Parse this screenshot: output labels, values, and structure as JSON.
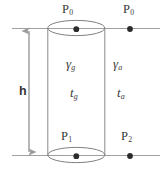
{
  "figure": {
    "colors": {
      "background": "#ffffff",
      "stroke": "#8c8c8c",
      "stroke_dark": "#6f6f6f",
      "dot": "#2b2b2b",
      "text": "#3a3a3a",
      "arrow": "#9a9a9a"
    },
    "labels": {
      "p0_top": {
        "symbol": "P",
        "subscript": "0",
        "text": "P0"
      },
      "p0_right": {
        "symbol": "P",
        "subscript": "0",
        "text": "P0"
      },
      "p1_bottom": {
        "symbol": "P",
        "subscript": "1",
        "text": "P1"
      },
      "p2_bottom_right": {
        "symbol": "P",
        "subscript": "2",
        "text": "P2"
      },
      "gamma_g": {
        "symbol": "γ",
        "subscript": "g",
        "text": "γg"
      },
      "gamma_a": {
        "symbol": "γ",
        "subscript": "a",
        "text": "γa"
      },
      "t_g": {
        "symbol": "t",
        "subscript": "g",
        "text": "tg"
      },
      "t_a": {
        "symbol": "t",
        "subscript": "a",
        "text": "ta"
      },
      "height": {
        "symbol": "h",
        "text": "h"
      }
    },
    "geometry": {
      "cylinder": {
        "left_x": 48,
        "right_x": 105,
        "top_y": 28,
        "bottom_y": 155,
        "ellipse_rx": 28.5,
        "ellipse_ry": 7.5
      },
      "datum_lines": [
        {
          "name": "upper-datum-line",
          "y": 28,
          "x_start": 12,
          "x_end": 160
        },
        {
          "name": "lower-datum-line",
          "y": 155,
          "x_start": 12,
          "x_end": 160
        }
      ],
      "points": [
        {
          "name": "point-p0-cylinder-axis",
          "x": 76,
          "y": 28
        },
        {
          "name": "point-p0-outside",
          "x": 130,
          "y": 28
        },
        {
          "name": "point-p1-cylinder-axis",
          "x": 76,
          "y": 155
        },
        {
          "name": "point-p2-outside",
          "x": 130,
          "y": 155
        }
      ],
      "height_arrow": {
        "x": 29,
        "y_top": 27,
        "y_bottom": 157
      }
    }
  }
}
